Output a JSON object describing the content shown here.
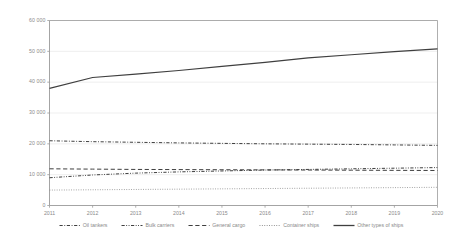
{
  "chart_data": {
    "type": "line",
    "title": "",
    "subtitle": "",
    "xlabel": "",
    "ylabel": "",
    "x": [
      2011,
      2012,
      2013,
      2014,
      2015,
      2016,
      2017,
      2018,
      2019,
      2020
    ],
    "xtick_labels": [
      "2011",
      "2012",
      "2013",
      "2014",
      "2015",
      "2016",
      "2017",
      "2018",
      "2019",
      "2020"
    ],
    "ytick_labels": [
      "0",
      "10 000",
      "20 000",
      "30 000",
      "40 000",
      "50 000",
      "60 000"
    ],
    "ytick_values": [
      0,
      10000,
      20000,
      30000,
      40000,
      50000,
      60000
    ],
    "ylim": [
      0,
      60000
    ],
    "xlim": [
      2011,
      2020
    ],
    "grid": true,
    "grid_axis": "y",
    "legend_position": "bottom",
    "series": [
      {
        "name": "Oil tankers",
        "style": "dash-dot",
        "color": "#3f3f3f",
        "values": [
          21000,
          20700,
          20500,
          20300,
          20150,
          20000,
          19900,
          19800,
          19650,
          19500
        ]
      },
      {
        "name": "Bulk carriers",
        "style": "dash-dot-dot",
        "color": "#3f3f3f",
        "values": [
          9000,
          9900,
          10500,
          10900,
          11200,
          11500,
          11700,
          11900,
          12100,
          12300
        ]
      },
      {
        "name": "General cargo",
        "style": "dashed",
        "color": "#3f3f3f",
        "values": [
          11900,
          11800,
          11700,
          11650,
          11600,
          11550,
          11500,
          11450,
          11400,
          11350
        ]
      },
      {
        "name": "Container ships",
        "style": "dotted",
        "color": "#8a8a8a",
        "values": [
          5000,
          5100,
          5200,
          5300,
          5400,
          5500,
          5600,
          5700,
          5800,
          5900
        ]
      },
      {
        "name": "Other types of ships",
        "style": "solid",
        "color": "#3f3f3f",
        "values": [
          38000,
          41500,
          42600,
          43800,
          45100,
          46400,
          47900,
          48900,
          49900,
          50800
        ]
      }
    ]
  },
  "colors": {
    "axis": "#9a9a9a",
    "grid": "#e8e8e8",
    "tick_text": "#8a8a8a",
    "line_dark": "#3f3f3f",
    "line_light": "#8a8a8a",
    "background": "#ffffff"
  }
}
